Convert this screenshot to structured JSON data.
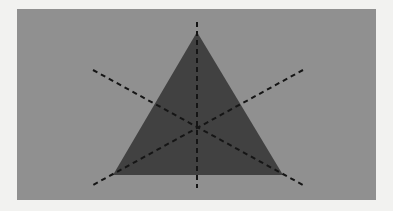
{
  "figure": {
    "title": "Equilateral triangle with three dashed lines of symmetry",
    "canvas": {
      "width": 393,
      "height": 211
    },
    "outer_background_color": "#f2f2f0",
    "panel": {
      "name": "gray-panel",
      "x": 17,
      "y": 9,
      "width": 359,
      "height": 191,
      "fill_color": "#909090"
    },
    "triangle": {
      "name": "equilateral-triangle",
      "fill_color": "#414141",
      "vertices": [
        {
          "label": "apex",
          "x": 197,
          "y": 32
        },
        {
          "label": "bottom-left",
          "x": 113,
          "y": 175
        },
        {
          "label": "bottom-right",
          "x": 283,
          "y": 175
        }
      ],
      "centroid": {
        "x": 197.7,
        "y": 127.3
      }
    },
    "symmetry_lines": {
      "stroke_color": "#151515",
      "stroke_width": 2,
      "dash_length": 5,
      "gap_length": 4,
      "count": 3,
      "lines": [
        {
          "label": "vertical-axis",
          "through_vertex": "apex",
          "x1": 197,
          "y1": 22,
          "x2": 197,
          "y2": 188
        },
        {
          "label": "left-diagonal-axis",
          "through_vertex": "bottom-right",
          "x1": 93,
          "y1": 70,
          "x2": 303,
          "y2": 185
        },
        {
          "label": "right-diagonal-axis",
          "through_vertex": "bottom-left",
          "x1": 303,
          "y1": 70,
          "x2": 93,
          "y2": 185
        }
      ]
    }
  }
}
